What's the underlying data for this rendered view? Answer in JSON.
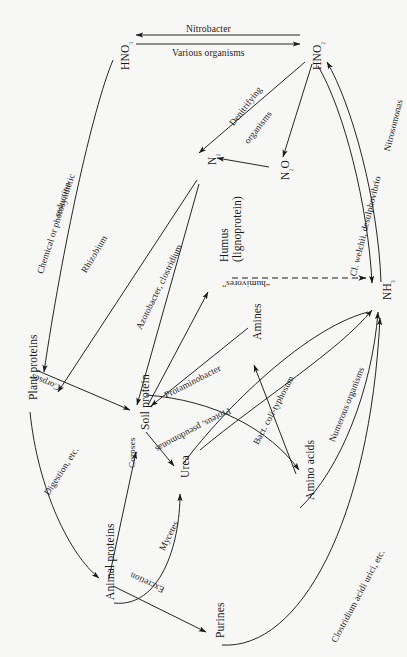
{
  "figure": {
    "background": "#f7f7f6",
    "ink": "#1a1a1a",
    "width": 407,
    "height": 657
  },
  "nodes": [
    {
      "id": "hno3",
      "label": "HNO₃",
      "x": 120,
      "y": 70,
      "rotate": -90
    },
    {
      "id": "hno2",
      "label": "HNO₂",
      "x": 312,
      "y": 70,
      "rotate": -90
    },
    {
      "id": "n2",
      "label": "N₂",
      "x": 207,
      "y": 165,
      "rotate": -90
    },
    {
      "id": "n2o",
      "label": "N₂O",
      "x": 280,
      "y": 180,
      "rotate": -90
    },
    {
      "id": "nh3",
      "label": "NH₃",
      "x": 382,
      "y": 300,
      "rotate": -90
    },
    {
      "id": "humus",
      "label": "Humus\n(lignoprotein)",
      "x": 218,
      "y": 262,
      "rotate": -90
    },
    {
      "id": "plant-proteins",
      "label": "Plant proteins",
      "x": 28,
      "y": 400,
      "rotate": -90
    },
    {
      "id": "soil-protein",
      "label": "Soil protein",
      "x": 140,
      "y": 430,
      "rotate": -90
    },
    {
      "id": "amines",
      "label": "Amines",
      "x": 252,
      "y": 340,
      "rotate": -90
    },
    {
      "id": "amino-acids",
      "label": "Amino acids",
      "x": 305,
      "y": 500,
      "rotate": -90
    },
    {
      "id": "urea",
      "label": "Urea",
      "x": 180,
      "y": 478,
      "rotate": -90
    },
    {
      "id": "animal-proteins",
      "label": "Animal proteins",
      "x": 105,
      "y": 600,
      "rotate": -90
    },
    {
      "id": "purines",
      "label": "Purines",
      "x": 215,
      "y": 638,
      "rotate": -90
    }
  ],
  "edge_labels": [
    {
      "id": "nitrobacter",
      "text": "Nitrobacter",
      "x": 186,
      "y": 24,
      "rotate": 0
    },
    {
      "id": "various-organisms",
      "text": "Various organisms",
      "x": 172,
      "y": 48,
      "rotate": 0
    },
    {
      "id": "denitrifying",
      "text": "Denitrifying",
      "x": 228,
      "y": 122,
      "rotate": -52
    },
    {
      "id": "organisms",
      "text": "organisms",
      "x": 243,
      "y": 140,
      "rotate": -52
    },
    {
      "id": "chem-photo",
      "text": "Chemical or photosynthetic",
      "x": 36,
      "y": 272,
      "rotate": -72
    },
    {
      "id": "reduction",
      "text": "reduction",
      "x": 53,
      "y": 215,
      "rotate": -72
    },
    {
      "id": "rhizobium",
      "text": "Rhizobium",
      "x": 80,
      "y": 270,
      "rotate": -59
    },
    {
      "id": "azotobacter",
      "text": "Azotobacter, clostridium",
      "x": 135,
      "y": 327,
      "rotate": -64
    },
    {
      "id": "cl-welchii",
      "text": "Cl. welchii, desulphovibrio",
      "x": 349,
      "y": 275,
      "rotate": -76
    },
    {
      "id": "nitrosomonas",
      "text": "Nitrosomonas",
      "x": 383,
      "y": 150,
      "rotate": -76
    },
    {
      "id": "humivores",
      "text": "“humivores”",
      "x": 270,
      "y": 288,
      "rotate": 180
    },
    {
      "id": "protaminobacter",
      "text": "Protaminobacter",
      "x": 163,
      "y": 392,
      "rotate": -27
    },
    {
      "id": "bact-coli",
      "text": "Bact. coli-typhosum",
      "x": 252,
      "y": 442,
      "rotate": -62
    },
    {
      "id": "numerous-organisms",
      "text": "Numerous organisms",
      "x": 328,
      "y": 440,
      "rotate": -68
    },
    {
      "id": "corpses-plant",
      "text": "Corpses",
      "x": 58,
      "y": 392,
      "rotate": 203
    },
    {
      "id": "corpses-animal",
      "text": "Corpses",
      "x": 128,
      "y": 468,
      "rotate": -90
    },
    {
      "id": "digestion",
      "text": "Digestion, etc.",
      "x": 43,
      "y": 492,
      "rotate": -57
    },
    {
      "id": "proteus",
      "text": "Proteus, pseudomonas",
      "x": 232,
      "y": 414,
      "rotate": 152
    },
    {
      "id": "mycetes",
      "text": "Mycetes",
      "x": 158,
      "y": 548,
      "rotate": -63
    },
    {
      "id": "excretion",
      "text": "Excretion",
      "x": 162,
      "y": 594,
      "rotate": 205
    },
    {
      "id": "clostridium-uric",
      "text": "Clostridium acidi urici, etc.",
      "x": 330,
      "y": 640,
      "rotate": -62
    }
  ],
  "edges": [
    {
      "id": "hno2-to-hno3",
      "from": "HNO₂",
      "to": "HNO₃",
      "label": "Nitrobacter",
      "style": "solid"
    },
    {
      "id": "hno3-to-hno2",
      "from": "HNO₃",
      "to": "HNO₂",
      "label": "Various organisms",
      "style": "solid"
    },
    {
      "id": "hno2-to-n2",
      "from": "HNO₂",
      "to": "N₂",
      "label": "Denitrifying organisms",
      "style": "solid"
    },
    {
      "id": "hno2-to-n2o",
      "from": "HNO₂",
      "to": "N₂O",
      "label": "",
      "style": "solid"
    },
    {
      "id": "n2o-to-n2",
      "from": "N₂O",
      "to": "N₂",
      "label": "",
      "style": "solid"
    },
    {
      "id": "hno3-to-plant",
      "from": "HNO₃",
      "to": "Plant proteins",
      "label": "Chemical or photosynthetic reduction",
      "style": "solid"
    },
    {
      "id": "n2-to-plant",
      "from": "N₂",
      "to": "Plant proteins",
      "label": "Rhizobium",
      "style": "solid"
    },
    {
      "id": "soil-to-n2",
      "from": "Soil protein",
      "to": "N₂",
      "label": "Azotobacter, clostridium",
      "style": "solid"
    },
    {
      "id": "nh3-to-hno2",
      "from": "NH₃",
      "to": "HNO₂",
      "label": "Nitrosomonas",
      "style": "solid"
    },
    {
      "id": "hno2-to-nh3",
      "from": "HNO₂",
      "to": "NH₃",
      "label": "Cl. welchii, desulphovibrio",
      "style": "solid"
    },
    {
      "id": "humus-to-nh3",
      "from": "Humus (lignoprotein)",
      "to": "NH₃",
      "label": "“humivores”",
      "style": "dashed"
    },
    {
      "id": "soil-to-humus",
      "from": "Soil protein",
      "to": "Humus (lignoprotein)",
      "label": "",
      "style": "solid"
    },
    {
      "id": "amines-to-soil",
      "from": "Amines",
      "to": "Soil protein",
      "label": "Protaminobacter",
      "style": "solid"
    },
    {
      "id": "amino-to-amines",
      "from": "Amino acids",
      "to": "Amines",
      "label": "Bact. coli-typhosum",
      "style": "solid"
    },
    {
      "id": "soil-to-amino",
      "from": "Soil protein",
      "to": "Amino acids",
      "label": "Proteus, pseudomonas",
      "style": "solid"
    },
    {
      "id": "amino-to-nh3",
      "from": "Amino acids",
      "to": "NH₃",
      "label": "Numerous organisms",
      "style": "solid"
    },
    {
      "id": "plant-to-soil",
      "from": "Plant proteins",
      "to": "Soil protein",
      "label": "Corpses",
      "style": "solid"
    },
    {
      "id": "plant-to-animal",
      "from": "Plant proteins",
      "to": "Animal proteins",
      "label": "Digestion, etc.",
      "style": "solid"
    },
    {
      "id": "animal-to-soil",
      "from": "Animal proteins",
      "to": "Soil protein",
      "label": "Corpses",
      "style": "solid"
    },
    {
      "id": "soil-to-urea",
      "from": "Soil protein",
      "to": "Urea",
      "label": "",
      "style": "solid"
    },
    {
      "id": "animal-to-urea",
      "from": "Animal proteins",
      "to": "Urea",
      "label": "Mycetes",
      "style": "solid"
    },
    {
      "id": "urea-to-nh3",
      "from": "Urea",
      "to": "NH₃",
      "label": "",
      "style": "solid"
    },
    {
      "id": "animal-to-purines",
      "from": "Animal proteins",
      "to": "Purines",
      "label": "Excretion",
      "style": "solid"
    },
    {
      "id": "purines-to-nh3",
      "from": "Purines",
      "to": "NH₃",
      "label": "Clostridium acidi urici, etc.",
      "style": "solid"
    }
  ]
}
